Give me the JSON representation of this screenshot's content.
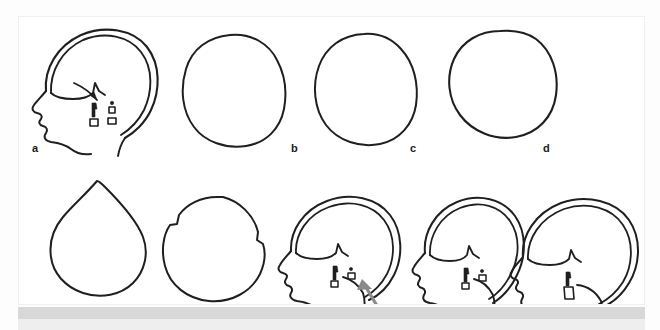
{
  "figure": {
    "kind": "line-drawing-figure",
    "background_color": "#ffffff",
    "card_color": "#ffffff",
    "ink_color": "#1f1f1f",
    "arrow_color": "#8a8a8a",
    "band_color": "#d8d8d8",
    "rows": 2,
    "columns_top": 4,
    "columns_bottom": 5,
    "panel_count": 9
  },
  "panels": [
    {
      "id": "a",
      "label": "a",
      "label_x": 30,
      "label_y": 142,
      "view": "lateral",
      "type": "head-profile",
      "description": "Lateral head profile with double-contour skull vault, facial profile, nasal and ear landmark marks",
      "has_arrow": false,
      "has_face": true,
      "double_contour": true
    },
    {
      "id": "b",
      "label": "b",
      "label_x": 290,
      "label_y": 142,
      "view": "vertex",
      "type": "skull-outline",
      "description": "Vertex view, elongated oval (scaphocephalic) cranial outline",
      "has_arrow": false,
      "has_face": false,
      "double_contour": false
    },
    {
      "id": "c",
      "label": "c",
      "label_x": 409,
      "label_y": 142,
      "view": "vertex",
      "type": "skull-outline",
      "description": "Vertex view, broad rounded cranial outline",
      "has_arrow": false,
      "has_face": false,
      "double_contour": false
    },
    {
      "id": "d",
      "label": "d",
      "label_x": 542,
      "label_y": 142,
      "view": "vertex",
      "type": "skull-outline",
      "description": "Vertex view, asymmetric oblique cranial outline (plagiocephaly)",
      "has_arrow": false,
      "has_face": false,
      "double_contour": false
    },
    {
      "id": "e",
      "label": "e",
      "label_x": 28,
      "label_y": 308,
      "view": "vertex",
      "type": "skull-outline",
      "description": "Vertex view, pointed triangular cranial outline (trigonocephaly)",
      "has_arrow": false,
      "has_face": false,
      "double_contour": false
    },
    {
      "id": "f",
      "label": "f",
      "label_x": 134,
      "label_y": 308,
      "view": "vertex",
      "type": "skull-outline",
      "description": "Vertex view, rounded cranial outline with stepped frontal bossing",
      "has_arrow": false,
      "has_face": false,
      "double_contour": false
    },
    {
      "id": "g",
      "label": "g",
      "label_x": 270,
      "label_y": 308,
      "view": "lateral",
      "type": "head-profile",
      "description": "Lateral head profile with double-contour vault and grey arrow pointing to the occipital region",
      "has_arrow": true,
      "has_face": true,
      "double_contour": true
    },
    {
      "id": "h",
      "label": "h",
      "label_x": 405,
      "label_y": 308,
      "view": "lateral",
      "type": "head-profile",
      "description": "Lateral head profile with double-contour vault, short rounded occiput",
      "has_arrow": false,
      "has_face": true,
      "double_contour": true
    },
    {
      "id": "i",
      "label": "i",
      "label_x": 502,
      "label_y": 308,
      "view": "lateral",
      "type": "head-profile",
      "description": "Lateral head profile with double-contour vault, elongated occiput",
      "has_arrow": false,
      "has_face": true,
      "double_contour": true
    }
  ]
}
